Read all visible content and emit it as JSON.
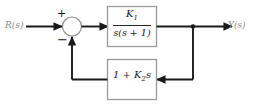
{
  "diagram": {
    "type": "control-system-block-diagram",
    "signals": {
      "input_label": "R(s)",
      "output_label": "Y(s)"
    },
    "summing_junction": {
      "name": "summing-junction",
      "plus_sign": "+",
      "minus_sign": "−",
      "plus_input": "R(s)",
      "minus_input": "feedback"
    },
    "blocks": [
      {
        "id": "forward-block",
        "role": "forward-path",
        "numerator": "K",
        "numerator_sub": "1",
        "denominator": "s(s + 1)",
        "expression": "K1/(s(s + 1))"
      },
      {
        "id": "feedback-block",
        "role": "feedback-path",
        "prefix": "1 + ",
        "gain": "K",
        "gain_sub": "2",
        "variable": "s",
        "expression": "1 + K2s"
      }
    ],
    "colors": {
      "wire": "#1a1a1a",
      "block_border": "#9a9a9a",
      "label_text": "#8a8a8a",
      "math_text": "#1a1a1a",
      "background": "#ffffff"
    }
  }
}
